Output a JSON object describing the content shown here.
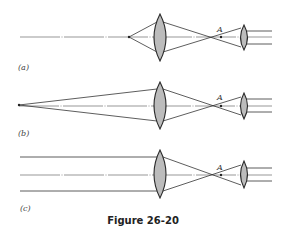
{
  "figure": {
    "caption": "Figure 26-20",
    "colors": {
      "lens_fill": "#bcbcbc",
      "line": "#333333",
      "background": "#ffffff"
    },
    "panels": [
      {
        "id": "a",
        "label": "(a)",
        "focus_label": "A",
        "source": "point source at finite distance near objective"
      },
      {
        "id": "b",
        "label": "(b)",
        "focus_label": "A",
        "source": "distant point source"
      },
      {
        "id": "c",
        "label": "(c)",
        "focus_label": "A",
        "source": "parallel rays (source at infinity)"
      }
    ]
  }
}
